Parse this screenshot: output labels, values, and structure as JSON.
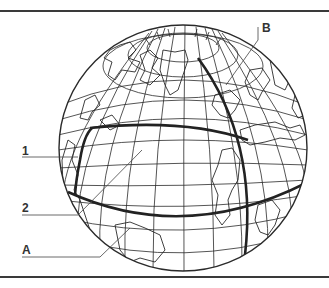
{
  "diagram": {
    "type": "globe-graticule-diagram",
    "labels": {
      "one": "1",
      "two": "2",
      "a": "A",
      "b": "B"
    },
    "highlighted_lines": {
      "parallel_1": "thick parallel line (labeled 1, upper)",
      "parallel_A": "thick parallel line (labeled A, lower)",
      "meridian_B": "thick meridian line (labeled B)",
      "route_2": "thick path line (labeled 2)"
    },
    "colors": {
      "line": "#2a2a2a",
      "frame": "#3a3a3a",
      "background": "#ffffff"
    }
  }
}
